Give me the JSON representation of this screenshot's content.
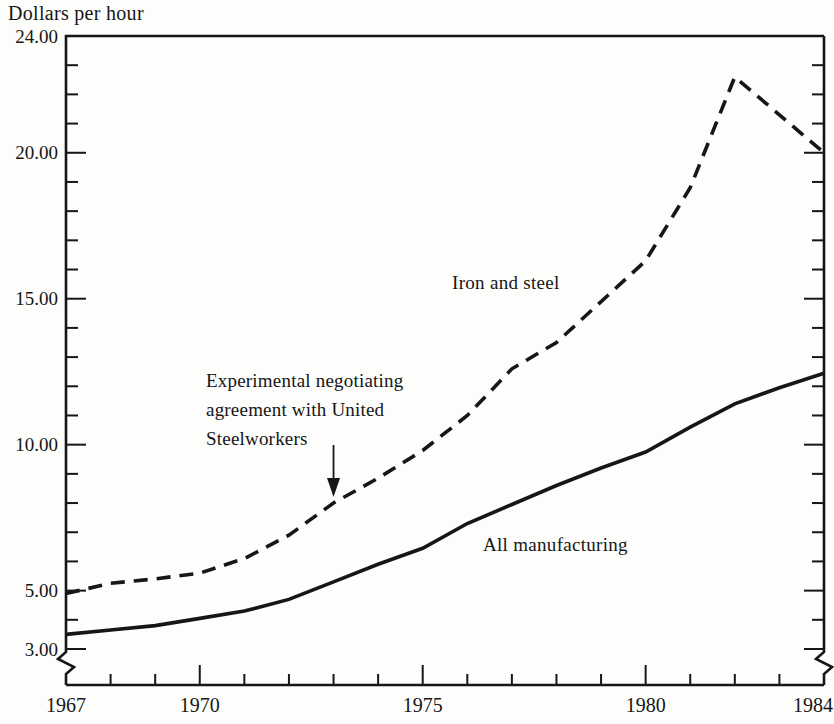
{
  "figure": {
    "background": "#fdfdfb",
    "ink": "#161616"
  },
  "chart_data": {
    "type": "line",
    "title": "Dollars per hour",
    "x": [
      1967,
      1968,
      1969,
      1970,
      1971,
      1972,
      1973,
      1974,
      1975,
      1976,
      1977,
      1978,
      1979,
      1980,
      1981,
      1982,
      1983,
      1984
    ],
    "series": [
      {
        "name": "Iron and steel",
        "line_style": "dashed",
        "values": [
          4.9,
          5.25,
          5.4,
          5.6,
          6.1,
          6.9,
          8.0,
          8.85,
          9.8,
          11.0,
          12.6,
          13.5,
          14.9,
          16.3,
          18.8,
          22.6,
          21.3,
          20.0
        ]
      },
      {
        "name": "All manufacturing",
        "line_style": "solid",
        "values": [
          3.5,
          3.65,
          3.8,
          4.05,
          4.3,
          4.7,
          5.3,
          5.9,
          6.45,
          7.3,
          7.95,
          8.6,
          9.2,
          9.75,
          10.6,
          11.4,
          11.95,
          12.45
        ]
      }
    ],
    "xlim": [
      1967,
      1984
    ],
    "ylim": [
      3,
      24
    ],
    "grid": false,
    "legend_position": "inline-labels",
    "y_axis": {
      "minor_tick_step": 1,
      "axis_break_below": 3,
      "labeled_ticks": [
        {
          "value": 24,
          "label": "24.00"
        },
        {
          "value": 20,
          "label": "20.00"
        },
        {
          "value": 15,
          "label": "15.00"
        },
        {
          "value": 10,
          "label": "10.00"
        },
        {
          "value": 5,
          "label": "5.00"
        },
        {
          "value": 3,
          "label": "3.00"
        }
      ]
    },
    "x_axis": {
      "minor_tick_step": 1,
      "labeled_ticks": [
        {
          "value": 1967,
          "label": "1967"
        },
        {
          "value": 1970,
          "label": "1970"
        },
        {
          "value": 1975,
          "label": "1975"
        },
        {
          "value": 1980,
          "label": "1980"
        },
        {
          "value": 1984,
          "label": "1984"
        }
      ]
    },
    "annotation": {
      "lines": [
        "Experimental negotiating",
        "agreement with United",
        "Steelworkers"
      ],
      "arrow_year": 1973,
      "arrow_value": 8.0
    }
  }
}
